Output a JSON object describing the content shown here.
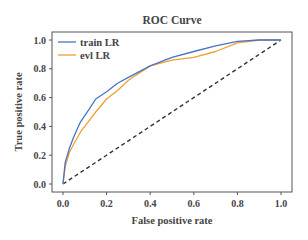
{
  "chart_data": {
    "type": "line",
    "title": "ROC Curve",
    "xlabel": "False positive rate",
    "ylabel": "True positive rate",
    "xlim": [
      0.0,
      1.0
    ],
    "ylim": [
      0.0,
      1.0
    ],
    "xticks": [
      "0.0",
      "0.2",
      "0.4",
      "0.6",
      "0.8",
      "1.0"
    ],
    "yticks": [
      "0.0",
      "0.2",
      "0.4",
      "0.6",
      "0.8",
      "1.0"
    ],
    "grid": false,
    "legend_position": "upper left",
    "series": [
      {
        "name": "train LR",
        "color": "#4a73c4",
        "x": [
          0.0,
          0.01,
          0.03,
          0.05,
          0.08,
          0.12,
          0.15,
          0.2,
          0.25,
          0.3,
          0.4,
          0.5,
          0.6,
          0.7,
          0.8,
          0.9,
          1.0
        ],
        "y": [
          0.0,
          0.15,
          0.25,
          0.33,
          0.43,
          0.52,
          0.59,
          0.64,
          0.7,
          0.74,
          0.82,
          0.88,
          0.92,
          0.96,
          0.99,
          1.0,
          1.0
        ]
      },
      {
        "name": "evl LR",
        "color": "#f0a030",
        "x": [
          0.0,
          0.01,
          0.03,
          0.05,
          0.08,
          0.12,
          0.15,
          0.2,
          0.25,
          0.3,
          0.4,
          0.5,
          0.6,
          0.7,
          0.8,
          0.9,
          1.0
        ],
        "y": [
          0.0,
          0.12,
          0.22,
          0.28,
          0.36,
          0.44,
          0.5,
          0.59,
          0.65,
          0.72,
          0.82,
          0.86,
          0.88,
          0.92,
          0.98,
          1.0,
          1.0
        ]
      },
      {
        "name": "chance",
        "color": "#333333",
        "style": "dashed",
        "x": [
          0.0,
          1.0
        ],
        "y": [
          0.0,
          1.0
        ]
      }
    ]
  }
}
